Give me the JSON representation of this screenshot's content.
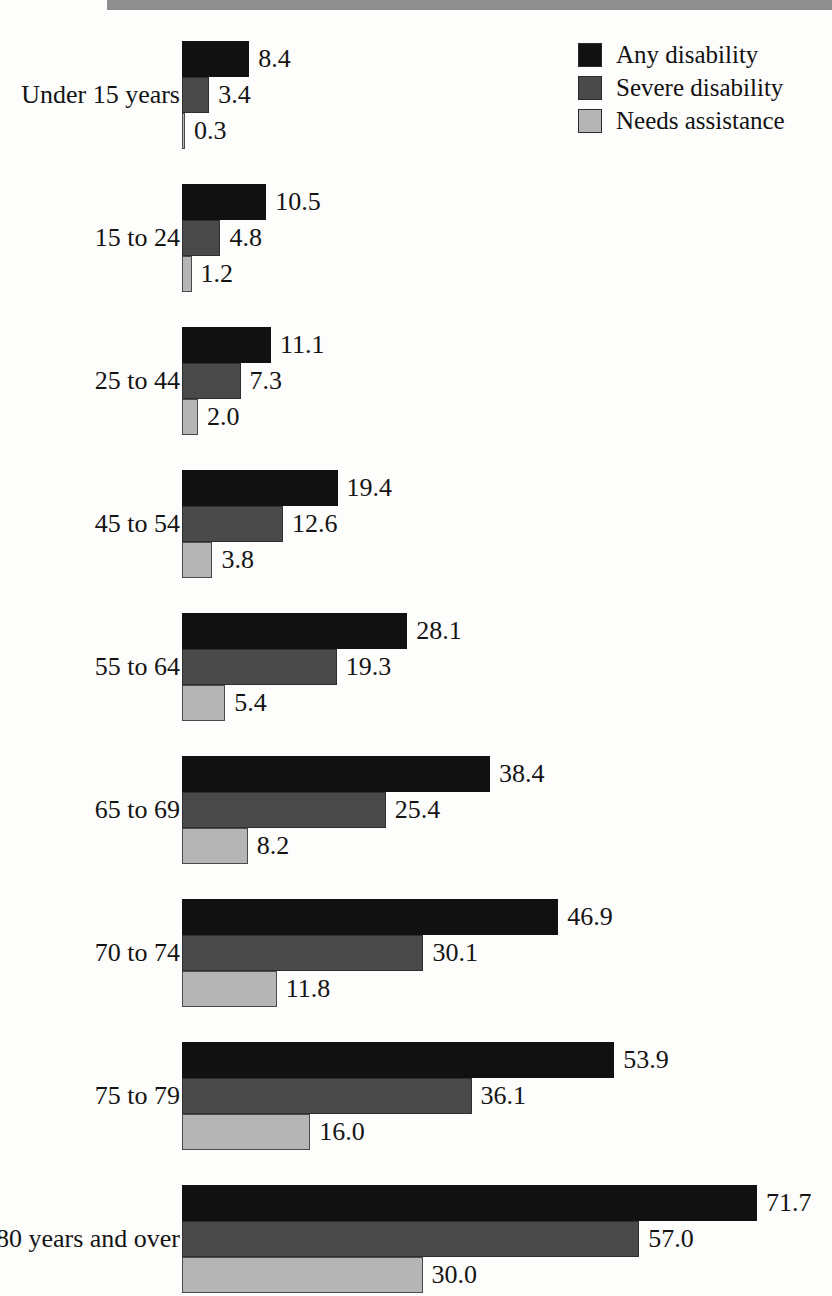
{
  "figure": {
    "top_band_color": "#8f8f8f"
  },
  "legend": {
    "items": [
      {
        "label": "Any disability",
        "color": "#111111",
        "swatch_name": "legend-swatch-any-disability"
      },
      {
        "label": "Severe disability",
        "color": "#4a4a4a",
        "swatch_name": "legend-swatch-severe-disability"
      },
      {
        "label": "Needs assistance",
        "color": "#b5b5b5",
        "swatch_name": "legend-swatch-needs-assistance"
      }
    ]
  },
  "chart_data": {
    "type": "bar",
    "orientation": "horizontal",
    "title": "",
    "subtitle": "",
    "xlabel": "",
    "ylabel": "",
    "xlim": [
      0,
      71.7
    ],
    "grid": false,
    "legend_position": "top-right",
    "value_label_format": "one-decimal",
    "categories": [
      "Under 15 years",
      "15 to 24",
      "25 to 44",
      "45 to 54",
      "55 to 64",
      "65 to 69",
      "70 to 74",
      "75 to 79",
      "80 years and over"
    ],
    "series": [
      {
        "name": "Any disability",
        "color": "#111111",
        "values": [
          8.4,
          10.5,
          11.1,
          19.4,
          28.1,
          38.4,
          46.9,
          53.9,
          71.7
        ],
        "labels": [
          "8.4",
          "10.5",
          "11.1",
          "19.4",
          "28.1",
          "38.4",
          "46.9",
          "53.9",
          "71.7"
        ]
      },
      {
        "name": "Severe disability",
        "color": "#4a4a4a",
        "values": [
          3.4,
          4.8,
          7.3,
          12.6,
          19.3,
          25.4,
          30.1,
          36.1,
          57.0
        ],
        "labels": [
          "3.4",
          "4.8",
          "7.3",
          "12.6",
          "19.3",
          "25.4",
          "30.1",
          "36.1",
          "57.0"
        ]
      },
      {
        "name": "Needs assistance",
        "color": "#b5b5b5",
        "values": [
          0.3,
          1.2,
          2.0,
          3.8,
          5.4,
          8.2,
          11.8,
          16.0,
          30.0
        ],
        "labels": [
          "0.3",
          "1.2",
          "2.0",
          "3.8",
          "5.4",
          "8.2",
          "11.8",
          "16.0",
          "30.0"
        ]
      }
    ]
  },
  "layout": {
    "bar_origin_x": 182,
    "px_per_unit": 8.02,
    "bar_height": 36,
    "group_top": 41,
    "group_pitch": 143,
    "value_gap": 9
  }
}
